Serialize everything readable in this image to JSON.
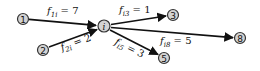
{
  "diagram": {
    "type": "flow-network",
    "nodes": [
      {
        "id": "1",
        "label": "1",
        "x": 23,
        "y": 19
      },
      {
        "id": "2",
        "label": "2",
        "x": 43,
        "y": 50
      },
      {
        "id": "i",
        "label": "i",
        "x": 104,
        "y": 26
      },
      {
        "id": "3",
        "label": "3",
        "x": 173,
        "y": 15
      },
      {
        "id": "5",
        "label": "5",
        "x": 164,
        "y": 58
      },
      {
        "id": "8",
        "label": "8",
        "x": 240,
        "y": 38
      }
    ],
    "edges": [
      {
        "from": "1",
        "to": "i",
        "var": "f",
        "sub": "1i",
        "eq": " = 7",
        "value": 7
      },
      {
        "from": "2",
        "to": "i",
        "var": "f",
        "sub": "2i",
        "eq": " = 2",
        "value": 2
      },
      {
        "from": "i",
        "to": "3",
        "var": "f",
        "sub": "i3",
        "eq": " = 1",
        "value": 1
      },
      {
        "from": "i",
        "to": "5",
        "var": "f",
        "sub": "i5",
        "eq": " = 3",
        "value": 3
      },
      {
        "from": "i",
        "to": "8",
        "var": "f",
        "sub": "i8",
        "eq": " = 5",
        "value": 5
      }
    ],
    "colors": {
      "node_fill": "#d3d3d3",
      "node_stroke": "#333333",
      "edge": "#111111",
      "background": "#ffffff"
    }
  }
}
